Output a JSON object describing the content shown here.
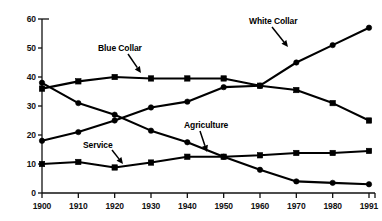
{
  "chart_data": {
    "type": "line",
    "title": "",
    "subtitle": "",
    "xlabel": "",
    "ylabel": "",
    "x": [
      1900,
      1910,
      1920,
      1930,
      1940,
      1950,
      1960,
      1970,
      1980,
      1991
    ],
    "x_tick_labels": [
      "1900",
      "1910",
      "1920",
      "1930",
      "1940",
      "1950",
      "1960",
      "1970",
      "1980",
      "1991"
    ],
    "y_tick_labels": [
      "0",
      "10",
      "20",
      "30",
      "40",
      "50",
      "60"
    ],
    "y_ticks": [
      0,
      10,
      20,
      30,
      40,
      50,
      60
    ],
    "ylim": [
      0,
      60
    ],
    "grid": false,
    "legend_position": "inline-annotations",
    "series": [
      {
        "name": "Blue Collar",
        "marker": "square",
        "color": "#000000",
        "values": [
          36,
          38.5,
          40,
          39.5,
          39.5,
          39.5,
          37,
          35.5,
          31,
          25
        ]
      },
      {
        "name": "White Collar",
        "marker": "circle",
        "color": "#000000",
        "values": [
          18,
          21,
          25,
          29.5,
          31.5,
          36.5,
          37,
          45,
          51,
          57
        ]
      },
      {
        "name": "Agriculture",
        "marker": "circle",
        "color": "#000000",
        "values": [
          38,
          31,
          27,
          21.5,
          17.5,
          12.5,
          8,
          4,
          3.5,
          3
        ]
      },
      {
        "name": "Service",
        "marker": "square",
        "color": "#000000",
        "values": [
          10,
          10.7,
          8.8,
          10.5,
          12.5,
          12.5,
          13,
          13.8,
          13.8,
          14.5
        ]
      }
    ],
    "annotations": [
      {
        "text": "Blue Collar",
        "series": "Blue Collar",
        "label_x": 98,
        "label_y": 43,
        "arrow_from_x": 128,
        "arrow_from_y": 54,
        "arrow_to_x": 141,
        "arrow_to_y": 73
      },
      {
        "text": "White Collar",
        "series": "White Collar",
        "label_x": 249,
        "label_y": 16,
        "arrow_from_x": 272,
        "arrow_from_y": 27,
        "arrow_to_x": 288,
        "arrow_to_y": 47
      },
      {
        "text": "Agriculture",
        "series": "Agriculture",
        "label_x": 184,
        "label_y": 120,
        "arrow_from_x": 200,
        "arrow_from_y": 131,
        "arrow_to_x": 207,
        "arrow_to_y": 152
      },
      {
        "text": "Service",
        "series": "Service",
        "label_x": 83,
        "label_y": 140,
        "arrow_from_x": 112,
        "arrow_from_y": 150,
        "arrow_to_x": 123,
        "arrow_to_y": 164
      }
    ]
  }
}
